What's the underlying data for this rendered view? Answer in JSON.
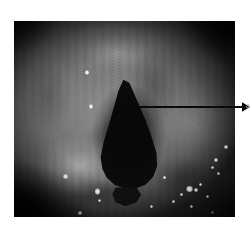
{
  "figure": {
    "kind": "endoscopic-photograph",
    "modality_label": "laryngoscopy",
    "color_mode": "grayscale",
    "page_background": "#ffffff"
  },
  "photo": {
    "frame": {
      "left": 14,
      "top": 21,
      "width": 221,
      "height": 196
    },
    "border_color": "#000000",
    "tones": {
      "mucosa_bright": "#8d8d8d",
      "mucosa_mid": "#6b6b6b",
      "mucosa_shadow": "#333333",
      "airway_black": "#050505",
      "specular_white": "#ffffff"
    }
  },
  "glottis": {
    "label": "glottic-opening",
    "shape": "teardrop",
    "fill": "#060606",
    "polygon_percent": "49.5,30 52.2,31.5 55.5,40 59.5,50.5 62.5,60 64.5,67.5 64.8,74 63.0,79.5 59.5,83.5 55.0,85.5 50.0,85.5 45.5,83.5 42.0,80.0 40.0,75.5 39.2,69.5 40.5,62.0 42.8,53.5 45.2,44.0 47.3,35.5"
  },
  "glottis_tail": {
    "label": "subglottic-shadow",
    "fill": "#0c0c0c",
    "polygon_percent": "46.0,85.0 55.5,85.0 57.5,88.5 55.5,92.5 50.5,94.5 46.0,92.5 44.5,88.5"
  },
  "arrow": {
    "label": "pointer-arrow",
    "color": "#0a0a0a",
    "line": {
      "x1": 131,
      "y1": 107,
      "x2": 242,
      "y2": 107,
      "width": 1.6
    },
    "head": {
      "points": "242,102.2 250,107 242,111.8",
      "tip_x": 250,
      "tip_y": 107
    },
    "direction": "points-left-to-right",
    "origin_target": "glottic-opening",
    "cutoff_text": "a"
  },
  "speculars": [
    {
      "name": "specular-left-upper",
      "x": 85,
      "y": 70,
      "w": 4,
      "h": 5
    },
    {
      "name": "specular-left-mid",
      "x": 89,
      "y": 104,
      "w": 4,
      "h": 5
    },
    {
      "name": "specular-left-lower-a",
      "x": 63,
      "y": 174,
      "w": 5,
      "h": 5
    },
    {
      "name": "specular-left-lower-b",
      "x": 95,
      "y": 188,
      "w": 5,
      "h": 7
    },
    {
      "name": "specular-left-lower-c",
      "x": 98,
      "y": 199,
      "w": 3,
      "h": 3
    },
    {
      "name": "specular-bottom-edge",
      "x": 78,
      "y": 211,
      "w": 4,
      "h": 4
    },
    {
      "name": "specular-right-upper",
      "x": 224,
      "y": 145,
      "w": 4,
      "h": 4
    },
    {
      "name": "specular-right-a",
      "x": 214,
      "y": 158,
      "w": 4,
      "h": 4
    },
    {
      "name": "specular-right-b",
      "x": 211,
      "y": 166,
      "w": 3,
      "h": 3
    },
    {
      "name": "specular-right-c",
      "x": 217,
      "y": 172,
      "w": 3,
      "h": 3
    },
    {
      "name": "specular-cluster-a",
      "x": 186,
      "y": 186,
      "w": 7,
      "h": 6
    },
    {
      "name": "specular-cluster-b",
      "x": 194,
      "y": 188,
      "w": 4,
      "h": 4
    },
    {
      "name": "specular-cluster-c",
      "x": 199,
      "y": 183,
      "w": 3,
      "h": 3
    },
    {
      "name": "specular-cluster-d",
      "x": 180,
      "y": 193,
      "w": 3,
      "h": 3
    },
    {
      "name": "specular-right-low-a",
      "x": 206,
      "y": 195,
      "w": 3,
      "h": 3
    },
    {
      "name": "specular-right-low-b",
      "x": 172,
      "y": 200,
      "w": 3,
      "h": 3
    },
    {
      "name": "specular-right-low-c",
      "x": 190,
      "y": 205,
      "w": 3,
      "h": 3
    },
    {
      "name": "specular-right-edge",
      "x": 211,
      "y": 211,
      "w": 3,
      "h": 3
    },
    {
      "name": "specular-mid-low",
      "x": 150,
      "y": 205,
      "w": 3,
      "h": 3
    },
    {
      "name": "specular-arrow-side",
      "x": 163,
      "y": 176,
      "w": 3,
      "h": 3
    }
  ]
}
